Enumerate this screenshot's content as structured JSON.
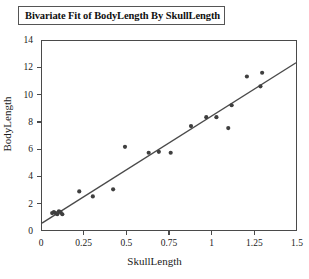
{
  "title": "Bivariate Fit of BodyLength By SkullLength",
  "chart_data": {
    "type": "scatter",
    "title": "Bivariate Fit of BodyLength By SkullLength",
    "xlabel": "SkullLength",
    "ylabel": "BodyLength",
    "xlim": [
      0,
      1.5
    ],
    "ylim": [
      0,
      14
    ],
    "xticks": [
      "0",
      "0.25",
      "0.5",
      "0.75",
      "1",
      "1.25",
      "1.5"
    ],
    "xtick_values": [
      0,
      0.25,
      0.5,
      0.75,
      1,
      1.25,
      1.5
    ],
    "yticks": [
      "0",
      "2",
      "4",
      "6",
      "8",
      "10",
      "12",
      "14"
    ],
    "ytick_values": [
      0,
      2,
      4,
      6,
      8,
      10,
      12,
      14
    ],
    "grid": false,
    "legend": null,
    "marker": "filled-circle",
    "marker_color": "#3f3f3f",
    "line_color": "#4a4a4a",
    "x": [
      0.06,
      0.07,
      0.08,
      0.09,
      0.1,
      0.11,
      0.12,
      0.22,
      0.3,
      0.42,
      0.49,
      0.63,
      0.69,
      0.76,
      0.88,
      0.97,
      1.03,
      1.1,
      1.12,
      1.21,
      1.29,
      1.3
    ],
    "y": [
      1.25,
      1.32,
      1.25,
      1.17,
      1.39,
      1.32,
      1.17,
      2.86,
      2.49,
      3.01,
      6.16,
      5.72,
      5.79,
      5.72,
      7.7,
      8.36,
      8.36,
      7.55,
      9.24,
      11.37,
      10.64,
      11.65
    ],
    "points": [
      {
        "x": 0.06,
        "y": 1.25
      },
      {
        "x": 0.07,
        "y": 1.32
      },
      {
        "x": 0.08,
        "y": 1.25
      },
      {
        "x": 0.09,
        "y": 1.17
      },
      {
        "x": 0.1,
        "y": 1.39
      },
      {
        "x": 0.11,
        "y": 1.32
      },
      {
        "x": 0.12,
        "y": 1.17
      },
      {
        "x": 0.22,
        "y": 2.86
      },
      {
        "x": 0.3,
        "y": 2.49
      },
      {
        "x": 0.42,
        "y": 3.01
      },
      {
        "x": 0.49,
        "y": 6.16
      },
      {
        "x": 0.63,
        "y": 5.72
      },
      {
        "x": 0.69,
        "y": 5.79
      },
      {
        "x": 0.76,
        "y": 5.72
      },
      {
        "x": 0.88,
        "y": 7.7
      },
      {
        "x": 0.97,
        "y": 8.36
      },
      {
        "x": 1.03,
        "y": 8.36
      },
      {
        "x": 1.1,
        "y": 7.55
      },
      {
        "x": 1.12,
        "y": 9.24
      },
      {
        "x": 1.21,
        "y": 11.37
      },
      {
        "x": 1.29,
        "y": 10.64
      },
      {
        "x": 1.3,
        "y": 11.65
      }
    ],
    "fit_line": {
      "type": "linear",
      "x0": 0.0,
      "y0": 0.51,
      "x1": 1.5,
      "y1": 12.39
    }
  }
}
